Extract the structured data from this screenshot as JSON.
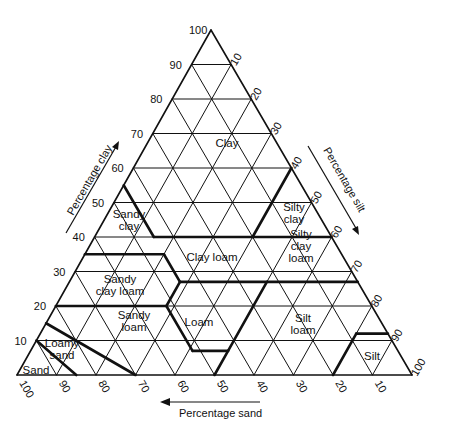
{
  "figure": {
    "caption_visible": false
  },
  "geometry": {
    "apex": [
      211,
      30
    ],
    "bottom_left": [
      17,
      375
    ],
    "bottom_right": [
      412,
      375
    ]
  },
  "axes": {
    "clay": {
      "label": "Percentage clay",
      "ticks": [
        "10",
        "20",
        "30",
        "40",
        "50",
        "60",
        "70",
        "80",
        "90",
        "100"
      ],
      "direction": "up"
    },
    "silt": {
      "label": "Percentage silt",
      "ticks": [
        "10",
        "20",
        "30",
        "40",
        "50",
        "60",
        "70",
        "80",
        "90",
        "100"
      ],
      "direction": "down-right"
    },
    "sand": {
      "label": "Percentage sand",
      "ticks": [
        "100",
        "90",
        "80",
        "70",
        "60",
        "50",
        "40",
        "30",
        "20",
        "10"
      ],
      "direction": "left"
    }
  },
  "regions": [
    {
      "name": "Clay",
      "lines": [
        "Clay"
      ],
      "pos": [
        227,
        143
      ]
    },
    {
      "name": "Sandy clay",
      "lines": [
        "Sandy",
        "clay"
      ],
      "pos": [
        129,
        220
      ]
    },
    {
      "name": "Silty clay",
      "lines": [
        "Silty",
        "clay"
      ],
      "pos": [
        294,
        213
      ]
    },
    {
      "name": "Clay loam",
      "lines": [
        "Clay loam"
      ],
      "pos": [
        212,
        257
      ]
    },
    {
      "name": "Silty clay loam",
      "lines": [
        "Silty",
        "clay",
        "loam"
      ],
      "pos": [
        301,
        246
      ]
    },
    {
      "name": "Sandy clay loam",
      "lines": [
        "Sandy",
        "clay loam"
      ],
      "pos": [
        120,
        285
      ]
    },
    {
      "name": "Sandy loam",
      "lines": [
        "Sandy",
        "loam"
      ],
      "pos": [
        134,
        321
      ]
    },
    {
      "name": "Loam",
      "lines": [
        "Loam"
      ],
      "pos": [
        199,
        322
      ]
    },
    {
      "name": "Silt loam",
      "lines": [
        "Silt",
        "loam"
      ],
      "pos": [
        303,
        324
      ]
    },
    {
      "name": "Silt",
      "lines": [
        "Silt"
      ],
      "pos": [
        372,
        356
      ]
    },
    {
      "name": "Loamy sand",
      "lines": [
        "Loamy",
        "sand"
      ],
      "pos": [
        62,
        349
      ]
    },
    {
      "name": "Sand",
      "lines": [
        "Sand"
      ],
      "pos": [
        36,
        370
      ]
    }
  ],
  "chart_data": {
    "type": "ternary-diagram",
    "axes": [
      "Percentage clay",
      "Percentage silt",
      "Percentage sand"
    ],
    "tick_values": [
      10,
      20,
      30,
      40,
      50,
      60,
      70,
      80,
      90,
      100
    ],
    "grid_interval": 10,
    "classes": [
      {
        "name": "Clay",
        "boundary_clay_sand_silt": [
          [
            100,
            0,
            0
          ],
          [
            40,
            45,
            15
          ],
          [
            40,
            0,
            60
          ]
        ]
      },
      {
        "name": "Sandy clay",
        "boundary_clay_sand_silt": [
          [
            35,
            65,
            0
          ],
          [
            35,
            45,
            20
          ],
          [
            55,
            45,
            0
          ]
        ]
      },
      {
        "name": "Silty clay",
        "boundary_clay_sand_silt": [
          [
            40,
            0,
            60
          ],
          [
            40,
            20,
            40
          ],
          [
            60,
            0,
            40
          ]
        ]
      },
      {
        "name": "Clay loam",
        "boundary_clay_sand_silt": [
          [
            27,
            45,
            28
          ],
          [
            40,
            45,
            15
          ],
          [
            40,
            20,
            40
          ],
          [
            27,
            20,
            53
          ]
        ]
      },
      {
        "name": "Silty clay loam",
        "boundary_clay_sand_silt": [
          [
            27,
            20,
            53
          ],
          [
            40,
            20,
            40
          ],
          [
            40,
            0,
            60
          ],
          [
            27,
            0,
            73
          ]
        ]
      },
      {
        "name": "Sandy clay loam",
        "boundary_clay_sand_silt": [
          [
            20,
            80,
            0
          ],
          [
            35,
            65,
            0
          ],
          [
            35,
            45,
            20
          ],
          [
            27,
            45,
            28
          ],
          [
            20,
            52,
            28
          ]
        ]
      },
      {
        "name": "Sandy loam",
        "boundary_clay_sand_silt": [
          [
            20,
            80,
            0
          ],
          [
            20,
            52,
            28
          ],
          [
            7,
            52,
            41
          ],
          [
            7,
            43,
            50
          ],
          [
            0,
            50,
            50
          ],
          [
            0,
            70,
            30
          ],
          [
            15,
            85,
            0
          ]
        ]
      },
      {
        "name": "Loam",
        "boundary_clay_sand_silt": [
          [
            7,
            52,
            41
          ],
          [
            27,
            45,
            28
          ],
          [
            27,
            23,
            50
          ],
          [
            7,
            43,
            50
          ]
        ]
      },
      {
        "name": "Silt loam",
        "boundary_clay_sand_silt": [
          [
            0,
            50,
            50
          ],
          [
            27,
            23,
            50
          ],
          [
            27,
            0,
            73
          ],
          [
            12,
            0,
            88
          ],
          [
            12,
            8,
            80
          ],
          [
            0,
            20,
            80
          ]
        ]
      },
      {
        "name": "Silt",
        "boundary_clay_sand_silt": [
          [
            0,
            20,
            80
          ],
          [
            12,
            8,
            80
          ],
          [
            12,
            0,
            88
          ],
          [
            0,
            0,
            100
          ]
        ]
      },
      {
        "name": "Loamy sand",
        "boundary_clay_sand_silt": [
          [
            15,
            85,
            0
          ],
          [
            0,
            70,
            30
          ],
          [
            0,
            85,
            15
          ],
          [
            10,
            90,
            0
          ]
        ]
      },
      {
        "name": "Sand",
        "boundary_clay_sand_silt": [
          [
            10,
            90,
            0
          ],
          [
            0,
            85,
            15
          ],
          [
            0,
            100,
            0
          ]
        ]
      }
    ]
  }
}
